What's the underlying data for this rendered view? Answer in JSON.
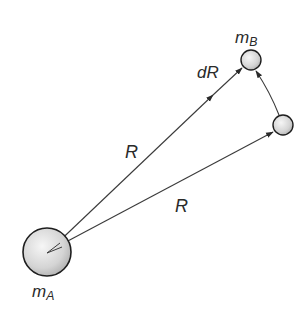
{
  "diagram": {
    "labels": {
      "mass_a": "m",
      "mass_a_sub": "A",
      "mass_b": "m",
      "mass_b_sub": "B",
      "dR": "dR",
      "R_upper": "R",
      "R_lower": "R"
    },
    "colors": {
      "line": "#3a3a3a",
      "sphere_fill_light": "#f4f4f4",
      "sphere_fill_dark": "#bdbdbd",
      "sphere_stroke": "#1e1e1e",
      "text": "#2a2a2a"
    },
    "nodes": [
      {
        "id": "mass-a",
        "cx": 47,
        "cy": 252,
        "r": 24
      },
      {
        "id": "mass-b",
        "cx": 251,
        "cy": 60,
        "r": 10
      },
      {
        "id": "mass-b-initial",
        "cx": 283,
        "cy": 125,
        "r": 10
      }
    ],
    "edges": [
      {
        "from": "mass-a",
        "to": "mass-b",
        "label": "R"
      },
      {
        "from": "mass-a",
        "to": "mass-b-initial",
        "label": "R"
      },
      {
        "from": "mass-b-initial",
        "to": "mass-b",
        "label": "dR"
      }
    ]
  }
}
